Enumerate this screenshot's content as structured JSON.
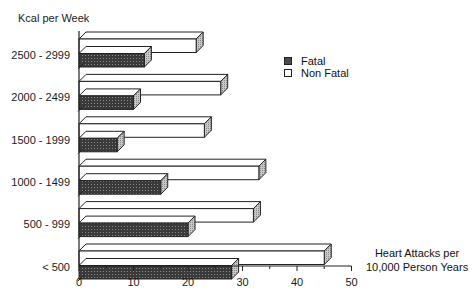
{
  "chart_data": {
    "type": "bar",
    "orientation": "horizontal",
    "style": "3d",
    "title": "",
    "ylabel": "Kcal per Week",
    "xlabel": "Heart Attacks per 10,000 Person Years",
    "categories": [
      "2500 - 2999",
      "2000 - 2499",
      "1500 - 1999",
      "1000 - 1499",
      "500 - 999",
      "< 500"
    ],
    "series": [
      {
        "name": "Fatal",
        "values": [
          12,
          10,
          7,
          15,
          20,
          28
        ],
        "pattern": "dark-stipple"
      },
      {
        "name": "Non Fatal",
        "values": [
          21.5,
          26,
          23,
          33,
          32,
          45
        ],
        "pattern": "white"
      }
    ],
    "xlim": [
      0,
      50
    ],
    "xticks": [
      "0",
      "10",
      "20",
      "30",
      "40",
      "50"
    ],
    "grid": false,
    "legend_position": "upper-right"
  },
  "labels": {
    "y_axis_title": "Kcal per Week",
    "x_axis_title_line1": "Heart Attacks per",
    "x_axis_title_line2": "10,000 Person Years",
    "legend_fatal": "Fatal",
    "legend_nonfatal": "Non Fatal",
    "cat0": "2500 - 2999",
    "cat1": "2000 - 2499",
    "cat2": "1500 - 1999",
    "cat3": "1000 - 1499",
    "cat4": "500 - 999",
    "cat5": "< 500",
    "t0": "0",
    "t1": "10",
    "t2": "20",
    "t3": "30",
    "t4": "40",
    "t5": "50"
  },
  "colors": {
    "fatal_front": "#4a4a4a",
    "side_shade": "#b5b5b5",
    "outline": "#222222",
    "nonfatal_front": "#ffffff"
  }
}
